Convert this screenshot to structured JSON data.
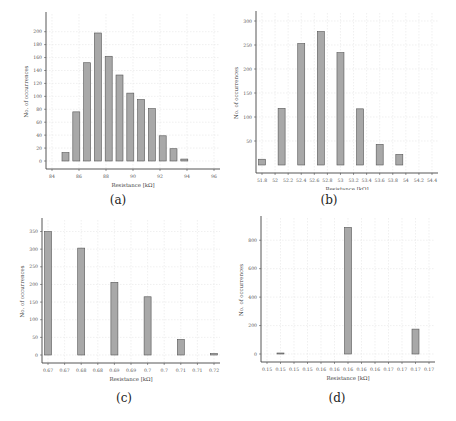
{
  "chart_data": [
    {
      "id": "a",
      "type": "bar",
      "caption": "(a)",
      "title": "",
      "xlabel": "Resistance [kΩ]",
      "ylabel": "No. of occurrences",
      "xticks": [
        "84",
        "86",
        "88",
        "90",
        "92",
        "94",
        "96"
      ],
      "yticks": [
        0,
        20,
        40,
        60,
        80,
        100,
        120,
        140,
        160,
        180,
        200
      ],
      "ylim": [
        0,
        215
      ],
      "grid": true,
      "bar_color": "#a8a8a8",
      "values": [
        13,
        76,
        152,
        198,
        162,
        133,
        105,
        95,
        81,
        39,
        19,
        3
      ],
      "bar_x": [
        85.0,
        85.8,
        86.6,
        87.4,
        88.2,
        89.0,
        89.8,
        90.6,
        91.4,
        92.2,
        93.0,
        93.8
      ],
      "xlim": [
        84,
        96
      ]
    },
    {
      "id": "b",
      "type": "bar",
      "caption": "(b)",
      "title": "",
      "xlabel": "Resistance [kΩ]",
      "ylabel": "No. of occurrences",
      "xticks": [
        "51.8",
        "52",
        "52.2",
        "52.4",
        "52.6",
        "52.8",
        "53",
        "53.2",
        "53.4",
        "53.6",
        "53.8",
        "54",
        "54.2",
        "54.4"
      ],
      "yticks": [
        50,
        100,
        150,
        200,
        250,
        300
      ],
      "ylim": [
        0,
        300
      ],
      "grid": true,
      "bar_color": "#a8a8a8",
      "values": [
        12,
        118,
        253,
        278,
        234,
        117,
        43,
        22
      ],
      "bar_x": [
        51.8,
        52.1,
        52.4,
        52.7,
        53.0,
        53.3,
        53.6,
        53.9
      ],
      "xlim": [
        51.8,
        54.4
      ]
    },
    {
      "id": "c",
      "type": "bar",
      "caption": "(c)",
      "title": "",
      "xlabel": "Resistance [kΩ]",
      "ylabel": "No. of occurrences",
      "xticks": [
        "0.67",
        "0.67",
        "0.68",
        "0.68",
        "0.69",
        "0.69",
        "0.7",
        "0.7",
        "0.71",
        "0.71",
        "0.72"
      ],
      "yticks": [
        0,
        50,
        100,
        150,
        200,
        250,
        300,
        350
      ],
      "ylim": [
        0,
        360
      ],
      "grid": true,
      "bar_color": "#a8a8a8",
      "values": [
        350,
        303,
        206,
        165,
        44,
        4
      ],
      "bar_x": [
        0,
        2,
        4,
        6,
        8,
        10
      ],
      "xlim": [
        0,
        10
      ]
    },
    {
      "id": "d",
      "type": "bar",
      "caption": "(d)",
      "title": "",
      "xlabel": "Resistance [kΩ]",
      "ylabel": "No. of occurrences",
      "xticks": [
        "0.15",
        "0.15",
        "0.15",
        "0.15",
        "0.16",
        "0.16",
        "0.16",
        "0.16",
        "0.16",
        "0.17",
        "0.17",
        "0.17",
        "0.17"
      ],
      "yticks": [
        0,
        200,
        400,
        600,
        800
      ],
      "ylim": [
        0,
        900
      ],
      "grid": true,
      "bar_color": "#a8a8a8",
      "values": [
        3,
        890,
        175
      ],
      "bar_x": [
        1,
        6,
        11
      ],
      "xlim": [
        0,
        12
      ]
    }
  ]
}
